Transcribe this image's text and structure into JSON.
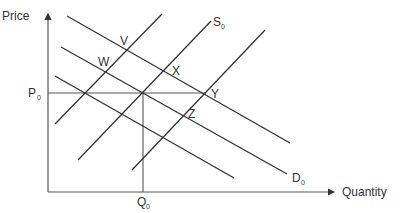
{
  "diagram": {
    "axes": {
      "y_label": "Price",
      "x_label": "Quantity"
    },
    "levels": {
      "price": {
        "base": "P",
        "sub": "0"
      },
      "quantity": {
        "base": "Q",
        "sub": "0"
      }
    },
    "curves": {
      "supply_label": {
        "base": "S",
        "sub": "0"
      },
      "demand_label": {
        "base": "D",
        "sub": "0"
      }
    },
    "points": {
      "v": "V",
      "w": "W",
      "x": "X",
      "y": "Y",
      "z": "Z"
    },
    "colors": {
      "line": "#333333",
      "axis": "#555555",
      "background": "#ffffff"
    }
  }
}
